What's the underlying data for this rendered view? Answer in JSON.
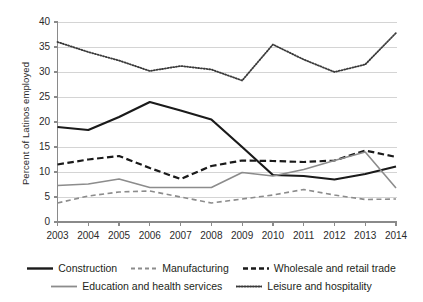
{
  "chart_data": {
    "type": "line",
    "title": "",
    "xlabel": "",
    "ylabel": "Percent of Latinos employed",
    "categories": [
      "2003",
      "2004",
      "2005",
      "2006",
      "2007",
      "2008",
      "2009",
      "2010",
      "2011",
      "2012",
      "2013",
      "2014"
    ],
    "x": [
      2003,
      2004,
      2005,
      2006,
      2007,
      2008,
      2009,
      2010,
      2011,
      2012,
      2013,
      2014
    ],
    "ylim": [
      0,
      40
    ],
    "yticks": [
      0,
      5,
      10,
      15,
      20,
      25,
      30,
      35,
      40
    ],
    "ytick_labels": [
      "0",
      "5",
      "10",
      "15",
      "20",
      "25",
      "30",
      "35",
      "40"
    ],
    "grid": true,
    "grid_axis": "y",
    "legend_position": "bottom",
    "series": [
      {
        "name": "Construction",
        "style": "solid",
        "color": "#1a1a1a",
        "width": 2.2,
        "values": [
          19.0,
          18.4,
          21.0,
          24.0,
          22.3,
          20.5,
          15.0,
          9.4,
          9.2,
          8.5,
          9.6,
          11.1
        ]
      },
      {
        "name": "Manufacturing",
        "style": "dashed",
        "color": "#8c8c8c",
        "width": 1.6,
        "values": [
          3.8,
          5.2,
          6.0,
          6.2,
          5.0,
          3.8,
          4.6,
          5.4,
          6.5,
          5.4,
          4.5,
          4.6
        ]
      },
      {
        "name": "Wholesale and retail trade",
        "style": "dashed-bold",
        "color": "#1a1a1a",
        "width": 2.2,
        "values": [
          11.5,
          12.5,
          13.2,
          10.8,
          8.6,
          11.2,
          12.3,
          12.2,
          12.0,
          12.3,
          14.3,
          13.0
        ]
      },
      {
        "name": "Education and health services",
        "style": "solid",
        "color": "#8c8c8c",
        "width": 1.6,
        "values": [
          7.3,
          7.6,
          8.6,
          6.9,
          6.9,
          6.9,
          9.9,
          9.2,
          10.5,
          12.3,
          14.0,
          6.8
        ]
      },
      {
        "name": "Leisure and hospitality",
        "style": "dotted",
        "color": "#3a3a3a",
        "width": 1.8,
        "values": [
          36.0,
          34.0,
          32.3,
          30.2,
          31.2,
          30.5,
          28.3,
          35.5,
          32.5,
          30.0,
          31.5,
          37.8
        ]
      }
    ]
  },
  "axes": {
    "y_title": "Percent of Latinos employed",
    "y_tick_labels": [
      "40",
      "35",
      "30",
      "25",
      "20",
      "15",
      "10",
      "5",
      "0"
    ],
    "x_tick_labels": [
      "2003",
      "2004",
      "2005",
      "2006",
      "2007",
      "2008",
      "2009",
      "2010",
      "2011",
      "2012",
      "2013",
      "2014"
    ]
  },
  "legend": {
    "row1": [
      {
        "label": "Construction",
        "swatch": "solid-black"
      },
      {
        "label": "Manufacturing",
        "swatch": "dashed-gray"
      },
      {
        "label": "Wholesale and retail trade",
        "swatch": "dashed-black"
      }
    ],
    "row2": [
      {
        "label": "Education and health services",
        "swatch": "solid-gray"
      },
      {
        "label": "Leisure and hospitality",
        "swatch": "dotted-black"
      }
    ]
  }
}
